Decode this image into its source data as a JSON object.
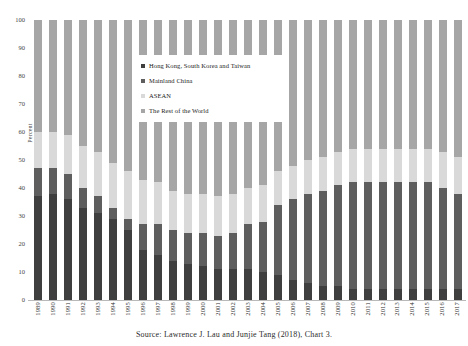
{
  "title_ghost": "",
  "source_note": "Source: Lawrence J. Lau and Junjie Tang (2018), Chart 3.",
  "axes": {
    "ylabel": "Percent",
    "yticks": [
      "0",
      "10",
      "20",
      "30",
      "40",
      "50",
      "60",
      "70",
      "80",
      "90",
      "100"
    ]
  },
  "legend": {
    "items": [
      {
        "label": "Hong Kong,  South Korea and Taiwan",
        "color": "#3f3f3f"
      },
      {
        "label": "Mainland China",
        "color": "#5e5e5e"
      },
      {
        "label": "ASEAN",
        "color": "#d9d9d9"
      },
      {
        "label": "The Rest of the World",
        "color": "#a6a6a6"
      }
    ]
  },
  "chart_data": {
    "type": "bar",
    "stacked": true,
    "percent_stacked": true,
    "title": "",
    "xlabel": "",
    "ylabel": "Percent",
    "ylim": [
      0,
      100
    ],
    "grid": false,
    "legend_position": "inside-top-right",
    "categories": [
      "1989",
      "1990",
      "1991",
      "1992",
      "1993",
      "1994",
      "1995",
      "1996",
      "1997",
      "1998",
      "1999",
      "2000",
      "2001",
      "2002",
      "2003",
      "2004",
      "2005",
      "2006",
      "2007",
      "2008",
      "2009",
      "2010",
      "2011",
      "2012",
      "2013",
      "2014",
      "2015",
      "2016",
      "2017"
    ],
    "series": [
      {
        "name": "Hong Kong,  South Korea and Taiwan",
        "color": "#3f3f3f",
        "values": [
          37,
          38,
          36,
          33,
          31,
          29,
          25,
          18,
          16,
          14,
          13,
          12,
          11,
          11,
          11,
          10,
          9,
          7,
          6,
          5,
          5,
          4,
          4,
          4,
          4,
          4,
          4,
          4,
          4
        ]
      },
      {
        "name": "Mainland China",
        "color": "#5e5e5e",
        "values": [
          10,
          9,
          9,
          7,
          6,
          4,
          4,
          9,
          11,
          11,
          11,
          12,
          12,
          13,
          16,
          18,
          25,
          29,
          32,
          34,
          36,
          38,
          38,
          38,
          38,
          38,
          38,
          36,
          34
        ]
      },
      {
        "name": "ASEAN",
        "color": "#d9d9d9",
        "values": [
          13,
          13,
          14,
          15,
          16,
          16,
          17,
          16,
          15,
          14,
          14,
          14,
          14,
          14,
          13,
          13,
          12,
          12,
          12,
          12,
          12,
          12,
          12,
          12,
          12,
          12,
          12,
          13,
          13
        ]
      },
      {
        "name": "The Rest of the World",
        "color": "#a6a6a6",
        "values": [
          40,
          40,
          41,
          45,
          47,
          51,
          54,
          57,
          58,
          61,
          62,
          62,
          63,
          62,
          60,
          59,
          54,
          52,
          50,
          49,
          47,
          46,
          46,
          46,
          46,
          46,
          46,
          47,
          49
        ]
      }
    ]
  }
}
